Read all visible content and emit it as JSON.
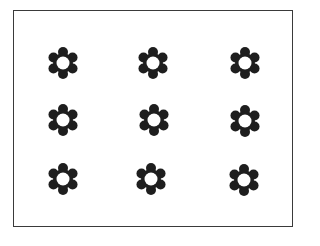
{
  "figure": {
    "rows": 3,
    "columns": 3,
    "count": 9,
    "shape": "six-petal flower with hollow center",
    "colors": {
      "petal": "#1e1e1e",
      "center": "#ffffff",
      "border": "#3a3a3a"
    },
    "flowers": [
      {
        "cx": 63,
        "cy": 63
      },
      {
        "cx": 153,
        "cy": 63
      },
      {
        "cx": 245,
        "cy": 63
      },
      {
        "cx": 63,
        "cy": 120
      },
      {
        "cx": 154,
        "cy": 120
      },
      {
        "cx": 245,
        "cy": 121
      },
      {
        "cx": 63,
        "cy": 179
      },
      {
        "cx": 151,
        "cy": 179
      },
      {
        "cx": 244,
        "cy": 180
      }
    ]
  }
}
